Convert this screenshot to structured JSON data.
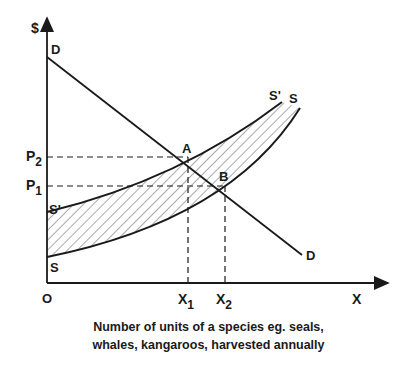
{
  "diagram": {
    "y_axis_label": "$",
    "x_axis_label": "X",
    "origin_label": "O",
    "price_labels": {
      "p2": "P",
      "p2_sub": "2",
      "p1": "P",
      "p1_sub": "1"
    },
    "quantity_labels": {
      "x1": "X",
      "x1_sub": "1",
      "x2": "X",
      "x2_sub": "2"
    },
    "curves": {
      "demand_top": "D",
      "demand_bottom": "D",
      "supply_prime_top": "S'",
      "supply_prime_bottom": "S'",
      "supply_top": "S",
      "supply_bottom": "S"
    },
    "points": {
      "a": "A",
      "b": "B"
    },
    "caption_line1": "Number of units of a species eg. seals,",
    "caption_line2": "whales, kangaroos, harvested annually",
    "colors": {
      "ink": "#1a1a1a",
      "background": "#ffffff",
      "hatch": "#555555"
    }
  }
}
